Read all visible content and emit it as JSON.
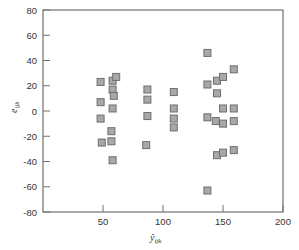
{
  "chart_data": {
    "type": "scatter",
    "title": "",
    "xlabel": "ŷ_ijk",
    "ylabel": "e_ijk",
    "xlim": [
      0,
      200
    ],
    "ylim": [
      -80,
      80
    ],
    "xticks": [
      50,
      100,
      150,
      200
    ],
    "yticks": [
      80,
      60,
      40,
      20,
      0,
      -20,
      -40,
      -60,
      -80
    ],
    "grid": false,
    "legend": null,
    "marker": {
      "shape": "square",
      "fill": "#a8a8a8",
      "stroke": "#6e6e6e"
    },
    "points": [
      {
        "x": 48,
        "y": 23
      },
      {
        "x": 48,
        "y": 7
      },
      {
        "x": 48,
        "y": -6
      },
      {
        "x": 49,
        "y": -25
      },
      {
        "x": 58,
        "y": 24
      },
      {
        "x": 61,
        "y": 27
      },
      {
        "x": 58,
        "y": 17
      },
      {
        "x": 59,
        "y": 12
      },
      {
        "x": 58,
        "y": 2
      },
      {
        "x": 57,
        "y": -16
      },
      {
        "x": 57,
        "y": -24
      },
      {
        "x": 58,
        "y": -39
      },
      {
        "x": 87,
        "y": 17
      },
      {
        "x": 87,
        "y": 9
      },
      {
        "x": 87,
        "y": -4
      },
      {
        "x": 86,
        "y": -27
      },
      {
        "x": 109,
        "y": 15
      },
      {
        "x": 109,
        "y": 2
      },
      {
        "x": 109,
        "y": -6
      },
      {
        "x": 109,
        "y": -13
      },
      {
        "x": 137,
        "y": 46
      },
      {
        "x": 137,
        "y": 21
      },
      {
        "x": 137,
        "y": -5
      },
      {
        "x": 137,
        "y": -63
      },
      {
        "x": 145,
        "y": 24
      },
      {
        "x": 145,
        "y": 14
      },
      {
        "x": 144,
        "y": -8
      },
      {
        "x": 145,
        "y": -35
      },
      {
        "x": 150,
        "y": 27
      },
      {
        "x": 150,
        "y": 2
      },
      {
        "x": 150,
        "y": -10
      },
      {
        "x": 150,
        "y": -33
      },
      {
        "x": 159,
        "y": 33
      },
      {
        "x": 159,
        "y": 2
      },
      {
        "x": 159,
        "y": -8
      },
      {
        "x": 159,
        "y": -31
      }
    ]
  },
  "labels": {
    "x_axis_main": "ŷ",
    "x_axis_sub": "ijk",
    "y_axis_main": "e",
    "y_axis_sub": "ijk"
  }
}
